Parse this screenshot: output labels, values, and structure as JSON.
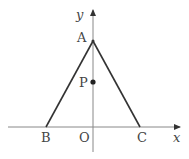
{
  "diagram": {
    "type": "coordinate-geometry",
    "axes": {
      "x_label": "x",
      "y_label": "y",
      "origin_label": "O"
    },
    "points": [
      {
        "label": "A",
        "position": "on y-axis, apex of triangle"
      },
      {
        "label": "B",
        "position": "on negative x-axis"
      },
      {
        "label": "C",
        "position": "on positive x-axis"
      },
      {
        "label": "P",
        "position": "on y-axis between A and O",
        "marked": true
      }
    ],
    "segments": [
      "AB",
      "AC"
    ],
    "colors": {
      "line": "#333333",
      "axis": "#888888",
      "text": "#444444",
      "background": "#ffffff"
    }
  },
  "labels": {
    "A": "A",
    "B": "B",
    "C": "C",
    "P": "P",
    "O": "O",
    "x": "x",
    "y": "y"
  }
}
